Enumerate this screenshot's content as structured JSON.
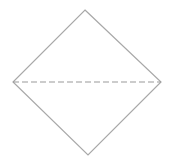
{
  "diagram": {
    "shape": "diamond",
    "vertices": {
      "top": [
        85,
        10
      ],
      "right": [
        161,
        82
      ],
      "bottom": [
        88,
        155
      ],
      "left": [
        13,
        82
      ]
    },
    "outline_color": "#a8a8a8",
    "diagonal": {
      "style": "dashed",
      "from": "left",
      "to": "right",
      "color": "#9a9a9a",
      "dash": "6,3"
    }
  }
}
